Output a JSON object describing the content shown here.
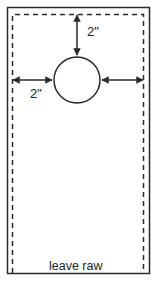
{
  "diagram": {
    "labels": {
      "top_offset": "2\"",
      "left_offset": "2\"",
      "bottom_edge": "leave raw"
    },
    "colors": {
      "line": "#2a2a2a",
      "background": "#ffffff"
    }
  }
}
